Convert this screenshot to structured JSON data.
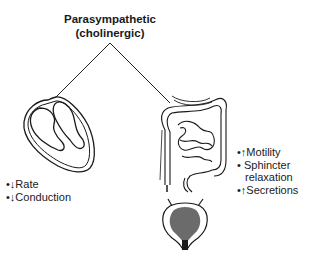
{
  "title": {
    "line1": "Parasympathetic",
    "line2": "(cholinergic)"
  },
  "heart": {
    "effects": [
      {
        "bullet": "•",
        "arrow": "↓",
        "text": "Rate"
      },
      {
        "bullet": "•",
        "arrow": "↓",
        "text": "Conduction"
      }
    ]
  },
  "intestine": {
    "effects": [
      {
        "bullet": "•",
        "arrow": "↑",
        "text": "Motility"
      },
      {
        "bullet": "•",
        "arrow": " ",
        "text": "Sphincter"
      },
      {
        "bullet": "",
        "arrow": "",
        "text": "relaxation"
      },
      {
        "bullet": "•",
        "arrow": "↑",
        "text": "Secretions"
      }
    ]
  },
  "colors": {
    "ink": "#1a1a1a",
    "background": "#ffffff"
  }
}
